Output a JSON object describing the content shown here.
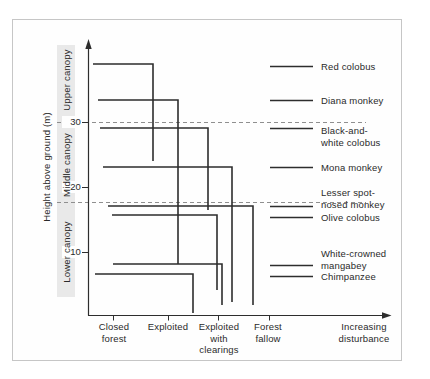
{
  "figure": {
    "background": "#ffffff",
    "frame_border_color": "#c6c6c6",
    "line_color": "#2d2d2d",
    "dashed_line_color": "#8f8f8f",
    "text_color": "#2a2a2a",
    "canopy_strip_color": "#e9e9e9"
  },
  "chart_data": {
    "type": "line",
    "subtype": "step-lines-showing-vertical-range-vs-disturbance",
    "title": "",
    "ylabel": "Height above ground (m)",
    "xlabel": "Increasing disturbance",
    "ylim": [
      0,
      42
    ],
    "grid": "off",
    "legend_position": "right",
    "y_ticks": [
      {
        "label": "30",
        "m": 30,
        "y_px": 122
      },
      {
        "label": "20",
        "m": 20,
        "y_px": 187
      },
      {
        "label": "10",
        "m": 10,
        "y_px": 252
      }
    ],
    "canopy_zones": [
      {
        "label": "Upper canopy",
        "center_y_px": 80
      },
      {
        "label": "Middle canopy",
        "center_y_px": 165
      },
      {
        "label": "Lower canopy",
        "center_y_px": 252
      }
    ],
    "zone_boundaries_m": [
      30,
      18
    ],
    "zone_boundary_lines_y_px": [
      122,
      202
    ],
    "categories": [
      {
        "label": "Closed\nforest",
        "x_px": 113,
        "label_cx": 114
      },
      {
        "label": "Exploited",
        "x_px": 168,
        "label_cx": 168
      },
      {
        "label": "Exploited\nwith\nclearings",
        "x_px": 218,
        "label_cx": 219
      },
      {
        "label": "Forest\nfallow",
        "x_px": 269,
        "label_cx": 268
      }
    ],
    "x_arrow_label": {
      "label": "Increasing\ndisturbance",
      "label_cx": 364
    },
    "species": [
      {
        "name": "Red colobus",
        "height_m": 39,
        "descends_to_m": 24,
        "disturbance_limit": 1.7,
        "x1": 93,
        "x2": 153,
        "y": 64,
        "drop_to_y": 161,
        "legend": {
          "label": "Red colobus",
          "text_top": 61,
          "key_y": 66
        }
      },
      {
        "name": "Diana monkey",
        "height_m": 33.5,
        "descends_to_m": 8.5,
        "disturbance_limit": 2.2,
        "x1": 98,
        "x2": 178,
        "y": 100,
        "drop_to_y": 264,
        "legend": {
          "label": "Diana monkey",
          "text_top": 95,
          "key_y": 100
        }
      },
      {
        "name": "Black-and-white colobus",
        "height_m": 29,
        "descends_to_m": 16.5,
        "disturbance_limit": 2.8,
        "x1": 100,
        "x2": 208,
        "y": 128,
        "drop_to_y": 210,
        "legend": {
          "label": "Black-and-\nwhite colobus",
          "text_top": 125,
          "key_y": 128
        }
      },
      {
        "name": "Mona monkey",
        "height_m": 23,
        "descends_to_m": 2.5,
        "disturbance_limit": 3.3,
        "x1": 103,
        "x2": 232,
        "y": 167,
        "drop_to_y": 302,
        "legend": {
          "label": "Mona monkey",
          "text_top": 162,
          "key_y": 167
        }
      },
      {
        "name": "Lesser spot-nosed monkey",
        "height_m": 17,
        "descends_to_m": 2,
        "disturbance_limit": 3.7,
        "x1": 108,
        "x2": 253,
        "y": 206,
        "drop_to_y": 305,
        "legend": {
          "label": "Lesser spot-\nnosed monkey",
          "text_top": 187,
          "key_y": 206
        }
      },
      {
        "name": "Olive colobus",
        "height_m": 16,
        "descends_to_m": 4.5,
        "disturbance_limit": 3.0,
        "x1": 112,
        "x2": 217,
        "y": 215,
        "drop_to_y": 290,
        "legend": {
          "label": "Olive colobus",
          "text_top": 212,
          "key_y": 217
        }
      },
      {
        "name": "White-crowned mangabey",
        "height_m": 8.5,
        "descends_to_m": 2,
        "disturbance_limit": 3.1,
        "x1": 113,
        "x2": 222,
        "y": 264,
        "drop_to_y": 305,
        "legend": {
          "label": "White-crowned\nmangabey",
          "text_top": 248,
          "key_y": 265
        }
      },
      {
        "name": "Chimpanzee",
        "height_m": 7,
        "descends_to_m": 1,
        "disturbance_limit": 2.5,
        "x1": 95,
        "x2": 193,
        "y": 274,
        "drop_to_y": 313,
        "legend": {
          "label": "Chimpanzee",
          "text_top": 271,
          "key_y": 276
        }
      }
    ]
  }
}
